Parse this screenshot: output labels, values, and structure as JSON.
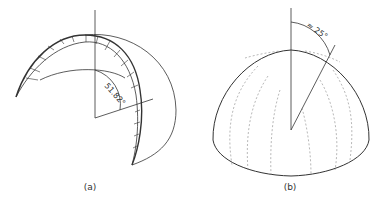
{
  "figure": {
    "panel_a": {
      "caption": "(a)",
      "angle_label": "51.82°",
      "description": "Half-dome arch segment with hatched pressure distribution along the arch"
    },
    "panel_b": {
      "caption": "(b)",
      "angle_label": "≈ 25°",
      "description": "Hemispherical dome with dashed meridian lines"
    }
  },
  "colors": {
    "line": "#333333",
    "dashed": "#888888"
  }
}
